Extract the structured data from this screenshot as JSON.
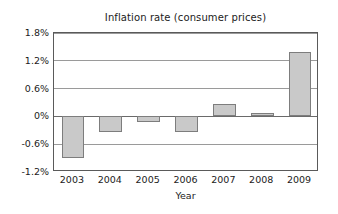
{
  "chart_data": {
    "type": "bar",
    "title": "Inflation rate (consumer prices)",
    "xlabel": "Year",
    "ylabel": "",
    "categories": [
      "2003",
      "2004",
      "2005",
      "2006",
      "2007",
      "2008",
      "2009"
    ],
    "values": [
      -0.9,
      -0.33,
      -0.12,
      -0.33,
      0.27,
      0.07,
      1.4
    ],
    "value_unit": "%",
    "ylim": [
      -1.2,
      1.8
    ],
    "yticks": [
      1.8,
      1.2,
      0.6,
      0,
      -0.6,
      -1.2
    ],
    "ytick_labels": [
      "1.8%",
      "1.2%",
      "0.6%",
      "0%",
      "-0.6%",
      "-1.2%"
    ],
    "grid": true,
    "legend": false,
    "bar_fill_color": "#c9c9c9",
    "bar_edge_color": "#7d7d7d",
    "frame_color": "#5a5a5a",
    "grid_color": "#9a9a9a",
    "text_color": "#1b1b1b",
    "background_color": "#ffffff"
  }
}
